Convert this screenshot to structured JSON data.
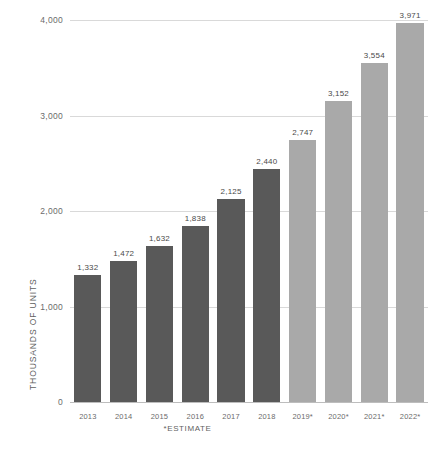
{
  "chart_data": {
    "type": "bar",
    "title": "",
    "xlabel": "",
    "ylabel": "THOUSANDS OF UNITS",
    "categories": [
      "2013",
      "2014",
      "2015",
      "2016",
      "2017",
      "2018",
      "2019*",
      "2020*",
      "2021*",
      "2022*"
    ],
    "values": [
      1332,
      1472,
      1632,
      1838,
      2125,
      2440,
      2747,
      3152,
      3554,
      3971
    ],
    "value_labels": [
      "1,332",
      "1,472",
      "1,632",
      "1,838",
      "2,125",
      "2,440",
      "2,747",
      "3,152",
      "3,554",
      "3,971"
    ],
    "series_kind": [
      "actual",
      "actual",
      "actual",
      "actual",
      "actual",
      "actual",
      "estimate",
      "estimate",
      "estimate",
      "estimate"
    ],
    "ylim": [
      0,
      4000
    ],
    "yticks": [
      0,
      1000,
      2000,
      3000,
      4000
    ],
    "ytick_labels": [
      "0",
      "1,000",
      "2,000",
      "3,000",
      "4,000"
    ],
    "grid": true,
    "legend": "none",
    "footnote": "*ESTIMATE",
    "colors": {
      "actual": "#595959",
      "estimate": "#a9a9a9",
      "gridline": "#d9d9d9",
      "axis": "#bdbdbd",
      "text": "#5f5f5f",
      "background": "#ffffff"
    }
  }
}
